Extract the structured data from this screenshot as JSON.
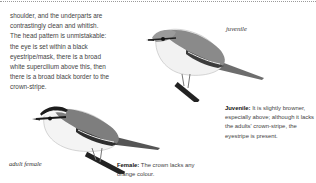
{
  "page": {
    "body_text": "shoulder, and the underparts are contrastingly clean and whitish. The head pattern is unmistakable: the eye is set within a black eyestripe/mask, there is a broad white supercilium above this, then there is a broad black border to the crown-stripe."
  },
  "illustrations": [
    {
      "id": "juvenile",
      "caption": "juvenile"
    },
    {
      "id": "adult-female",
      "caption": "adult female"
    }
  ],
  "descriptions": {
    "juvenile": {
      "label": "Juvenile:",
      "text": " It is slightly browner, especially above; although it lacks the adults' crown-stripe, the eyestripe is present."
    },
    "female": {
      "label": "Female:",
      "text": " The crown lacks any orange colour."
    }
  },
  "colors": {
    "text": "#444444",
    "label": "#111111",
    "rule": "#9a9a9a"
  }
}
